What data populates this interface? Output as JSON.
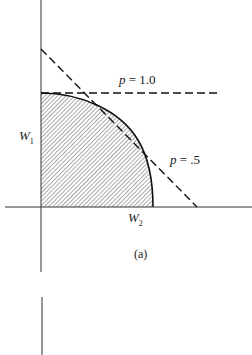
{
  "figure": {
    "caption": "(a)",
    "y_axis_label": "W",
    "y_axis_sub": "1",
    "x_axis_label": "W",
    "x_axis_sub": "2",
    "lines": [
      {
        "label_var": "p",
        "label_eq": "= 1.0",
        "style": "dashed",
        "orientation": "horizontal"
      },
      {
        "label_var": "p",
        "label_eq": "= .5",
        "style": "dashed",
        "orientation": "diagonal"
      }
    ],
    "region": {
      "fill": "hatched",
      "description": "feasible region bounded by concave frontier"
    }
  }
}
